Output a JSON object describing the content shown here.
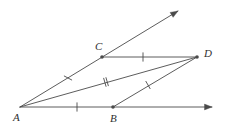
{
  "figure": {
    "kind": "geometry-diagram",
    "width": 225,
    "height": 131,
    "background_color": "#ffffff",
    "stroke_color": "#4a4a4a",
    "label_color": "#2f2f2f",
    "stroke_width": 0.9
  },
  "points": [
    {
      "id": "A",
      "label": "A",
      "x": 20,
      "y": 107,
      "dot": false,
      "label_x": 13,
      "label_y": 112
    },
    {
      "id": "B",
      "label": "B",
      "x": 113,
      "y": 107,
      "dot": true,
      "label_x": 110,
      "label_y": 113
    },
    {
      "id": "C",
      "label": "C",
      "x": 102,
      "y": 57,
      "dot": true,
      "label_x": 95,
      "label_y": 41
    },
    {
      "id": "D",
      "label": "D",
      "x": 197,
      "y": 57,
      "dot": true,
      "label_x": 204,
      "label_y": 48
    }
  ],
  "rays": [
    {
      "id": "ray-AC",
      "from": "A",
      "through": "C",
      "tip_x": 178,
      "tip_y": 11,
      "arrow": true
    },
    {
      "id": "ray-AB",
      "from": "A",
      "through": "B",
      "tip_x": 212,
      "tip_y": 107,
      "arrow": true
    }
  ],
  "segments": [
    {
      "id": "segment-CD",
      "from": "C",
      "to": "D",
      "x1": 102,
      "y1": 57,
      "x2": 197,
      "y2": 57
    },
    {
      "id": "segment-AD",
      "from": "A",
      "to": "D",
      "x1": 20,
      "y1": 107,
      "x2": 197,
      "y2": 57
    },
    {
      "id": "segment-BD",
      "from": "B",
      "to": "D",
      "x1": 113,
      "y1": 107,
      "x2": 197,
      "y2": 57
    }
  ],
  "tick_marks": [
    {
      "id": "tick-AC",
      "on": "segment-AC",
      "count": 1,
      "x": 68,
      "y": 78,
      "angle_deg": 28
    },
    {
      "id": "tick-CD",
      "on": "segment-CD",
      "count": 1,
      "x": 143,
      "y": 57,
      "angle_deg": 90
    },
    {
      "id": "tick-AD",
      "on": "segment-AD",
      "count": 2,
      "x": 106,
      "y": 82,
      "angle_deg": 74
    },
    {
      "id": "tick-BD",
      "on": "segment-BD",
      "count": 1,
      "x": 148,
      "y": 85,
      "angle_deg": 60
    },
    {
      "id": "tick-AB",
      "on": "segment-AB",
      "count": 1,
      "x": 77,
      "y": 107,
      "angle_deg": 90
    }
  ]
}
